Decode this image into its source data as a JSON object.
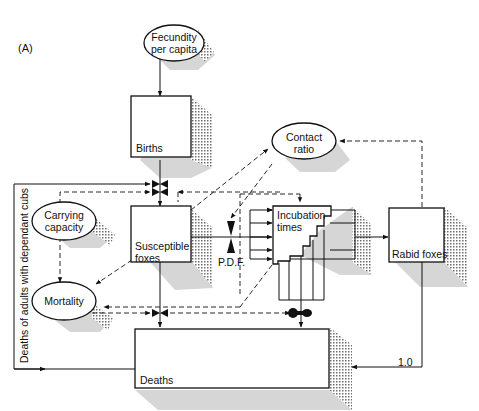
{
  "panel_label": "(A)",
  "nodes": {
    "fecundity": {
      "line1": "Fecundity",
      "line2": "per capita"
    },
    "births": {
      "label": "Births"
    },
    "contact_ratio": {
      "line1": "Contact",
      "line2": "ratio"
    },
    "carrying_capacity": {
      "line1": "Carrying",
      "line2": "capacity"
    },
    "susceptible": {
      "line1": "Susceptible",
      "line2": "foxes"
    },
    "pdf": {
      "label": "P.D.F."
    },
    "incubation": {
      "line1": "Incubation",
      "line2": "times"
    },
    "rabid": {
      "label": "Rabid foxes"
    },
    "mortality": {
      "label": "Mortality"
    },
    "deaths": {
      "label": "Deaths"
    }
  },
  "edge_labels": {
    "rabid_to_deaths": "1.0",
    "side_flow": "Deaths of adults with dependant cubs"
  },
  "colors": {
    "line": "#111111",
    "shadow": "#bdbdbd",
    "background": "#ffffff"
  }
}
